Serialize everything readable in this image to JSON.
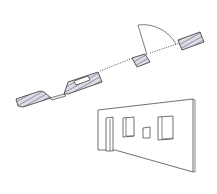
{
  "diagram": {
    "type": "architectural-illustration",
    "elements": {
      "plan_view": {
        "label": "wall plan section",
        "wall_segments": 5,
        "door_swing": "quarter-circle arc",
        "openings_line": "dotted"
      },
      "elevation_view": {
        "label": "wall in perspective",
        "openings": [
          "door",
          "window",
          "small window",
          "window"
        ]
      }
    },
    "colors": {
      "line": "#333333",
      "hatch_fill": "#d8d8e6",
      "hatch_line": "#555555",
      "background": "#ffffff"
    }
  }
}
